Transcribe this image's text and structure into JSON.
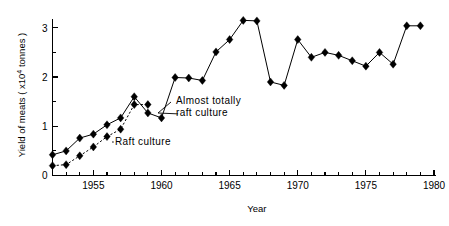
{
  "chart_data": {
    "type": "line",
    "title": "",
    "xlabel": "Year",
    "ylabel": "Yield of meats  ( x10⁴ tonnes )",
    "ylabel_parts": {
      "main": "Yield  of  meats  ( x10",
      "superscript": "4",
      "tail": " tonnes )"
    },
    "xlim": [
      1952,
      1980
    ],
    "ylim": [
      0,
      3.3
    ],
    "x_ticks_major": [
      1955,
      1960,
      1965,
      1970,
      1975,
      1980
    ],
    "x_tick_labels": [
      "1955",
      "1960",
      "1965",
      "1970",
      "1975",
      "1980"
    ],
    "x_ticks_minor_step": 1,
    "y_ticks_major": [
      0,
      1,
      2,
      3
    ],
    "y_tick_labels": [
      "0",
      "1",
      "2",
      "3"
    ],
    "y_ticks_minor": [
      0.5,
      1.5,
      2.5
    ],
    "grid": false,
    "legend": "none",
    "marker": "filled-diamond",
    "series": [
      {
        "name": "Total yield (almost totally raft culture)",
        "linestyle": "solid",
        "x": [
          1952,
          1953,
          1954,
          1955,
          1956,
          1957,
          1958,
          1959,
          1960,
          1961,
          1962,
          1963,
          1964,
          1965,
          1966,
          1967,
          1968,
          1969,
          1970,
          1971,
          1972,
          1973,
          1974,
          1975,
          1976,
          1977,
          1978,
          1979
        ],
        "values": [
          0.42,
          0.5,
          0.76,
          0.84,
          1.03,
          1.17,
          1.6,
          1.27,
          1.17,
          1.99,
          1.98,
          1.93,
          2.51,
          2.76,
          3.15,
          3.14,
          1.9,
          1.83,
          2.76,
          2.4,
          2.5,
          2.44,
          2.33,
          2.22,
          2.5,
          2.26,
          3.04,
          3.04
        ]
      },
      {
        "name": "Raft culture",
        "linestyle": "dotted",
        "x": [
          1952,
          1953,
          1954,
          1955,
          1956,
          1957,
          1958,
          1959
        ],
        "values": [
          0.2,
          0.22,
          0.4,
          0.58,
          0.79,
          0.94,
          1.44,
          1.44
        ]
      }
    ],
    "annotations": [
      {
        "text_lines": [
          "Almost  totally",
          "raft  culture"
        ],
        "target_x": 1961,
        "target_y": 1.17
      },
      {
        "text_lines": [
          "Raft  culture"
        ],
        "target_x": 1956.4,
        "target_y": 0.72
      }
    ]
  },
  "figure": {
    "background_color": "#ffffff",
    "ink_color": "#000000"
  }
}
